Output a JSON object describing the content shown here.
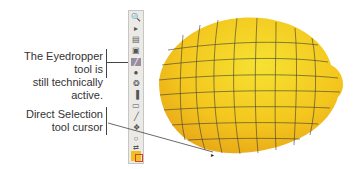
{
  "callouts": [
    {
      "text_line1": "The Eyedropper tool is",
      "text_line2": "still technically active."
    },
    {
      "text_line1": "Direct Selection",
      "text_line2": "tool cursor"
    }
  ],
  "toolbar": {
    "tools": [
      "zoom-tool",
      "direct-select-tool",
      "artboard-tool",
      "rectangle-tool",
      "eyedropper-tool",
      "blob-brush-tool",
      "symbol-sprayer-tool",
      "graph-tool",
      "slice-tool",
      "pen-tool",
      "mesh-tool",
      "lasso-tool",
      "swap-tool"
    ],
    "active_tool": "eyedropper-tool"
  },
  "colors": {
    "lemon": "#f2c21c",
    "lemon_highlight": "#f5e030",
    "mesh_line": "#3c3a36",
    "fill_swatch": "#f0c020",
    "stroke_swatch": "#d84030"
  }
}
